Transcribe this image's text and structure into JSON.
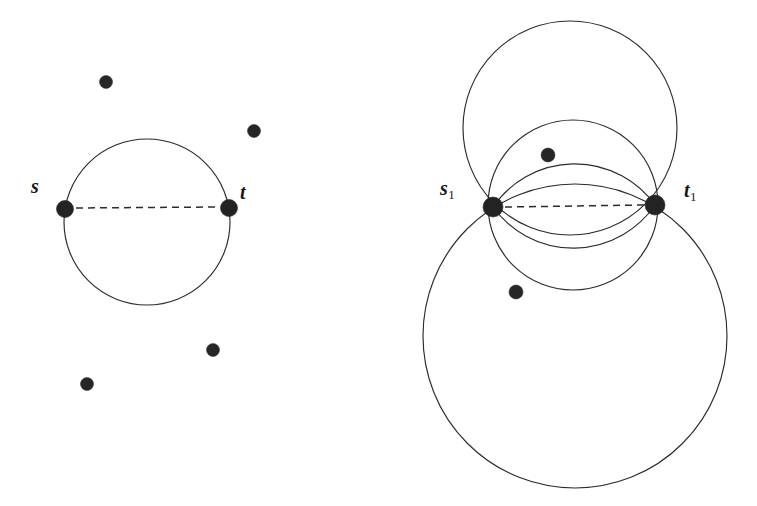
{
  "figure": {
    "background_color": "#ffffff",
    "stroke_color": "#2b2b2b",
    "node_color": "#232323",
    "width": 757,
    "height": 506
  },
  "left_panel": {
    "name": "single-circle-panel",
    "labels": {
      "s": {
        "text": "s",
        "x": 31,
        "y": 176
      },
      "t": {
        "text": "t",
        "x": 240,
        "y": 182
      }
    },
    "endpoints": [
      {
        "name": "s",
        "x": 65,
        "y": 209,
        "r": 8.5
      },
      {
        "name": "t",
        "x": 229,
        "y": 208,
        "r": 8.5
      }
    ],
    "circle": {
      "cx": 147,
      "cy": 222,
      "r": 83
    },
    "chord": {
      "x1": 74,
      "y1": 208,
      "x2": 220,
      "y2": 207
    },
    "scatter_points": [
      {
        "x": 106,
        "y": 82,
        "r": 6.5
      },
      {
        "x": 254,
        "y": 131,
        "r": 6.5
      },
      {
        "x": 213,
        "y": 350,
        "r": 6.5
      },
      {
        "x": 87,
        "y": 384,
        "r": 6.5
      }
    ]
  },
  "right_panel": {
    "name": "pencil-of-circles-panel",
    "labels": {
      "s1": {
        "text": "s",
        "sub": "1",
        "x": 440,
        "y": 178
      },
      "t1": {
        "text": "t",
        "sub": "1",
        "x": 684,
        "y": 180
      }
    },
    "endpoints": [
      {
        "name": "s1",
        "x": 493,
        "y": 207,
        "r": 10
      },
      {
        "name": "t1",
        "x": 655,
        "y": 205,
        "r": 10
      }
    ],
    "circles": [
      {
        "name": "top-large-circle",
        "cx": 570,
        "cy": 128,
        "r": 107
      },
      {
        "name": "middle-circle",
        "cx": 573,
        "cy": 205,
        "r": 85
      },
      {
        "name": "bottom-large-circle",
        "cx": 575,
        "cy": 336,
        "r": 152
      }
    ],
    "lens_arcs": [
      {
        "name": "lens-upper-arc",
        "sagitta": -38
      },
      {
        "name": "lens-lower-arc",
        "sagitta": 38
      }
    ],
    "chord": {
      "x1": 504,
      "y1": 207,
      "x2": 645,
      "y2": 205
    },
    "scatter_points": [
      {
        "x": 548,
        "y": 155,
        "r": 7
      },
      {
        "x": 516,
        "y": 292,
        "r": 7
      }
    ]
  }
}
